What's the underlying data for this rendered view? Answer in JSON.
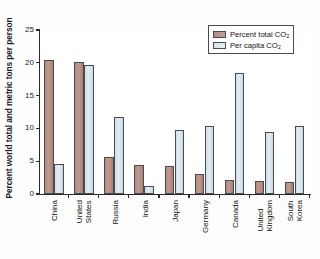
{
  "chart_data": {
    "type": "bar",
    "title": "",
    "xlabel": "",
    "ylabel": "Percent world total and metric tons per person",
    "ylim": [
      0,
      25
    ],
    "yticks": [
      0,
      5,
      10,
      15,
      20,
      25
    ],
    "grid": false,
    "legend_position": "top-right",
    "categories": [
      "China",
      "United States",
      "Russia",
      "India",
      "Japan",
      "Germany",
      "Canada",
      "United Kingdom",
      "South Korea"
    ],
    "category_lines": [
      [
        "China"
      ],
      [
        "United",
        "States"
      ],
      [
        "Russia"
      ],
      [
        "India"
      ],
      [
        "Japan"
      ],
      [
        "Germany"
      ],
      [
        "Canada"
      ],
      [
        "United",
        "Kingdom"
      ],
      [
        "South",
        "Korea"
      ]
    ],
    "series": [
      {
        "name": "Percent total CO2",
        "label_main": "Percent total CO",
        "label_sub": "2",
        "color": "#b3897e",
        "values": [
          20.4,
          20.2,
          5.6,
          4.4,
          4.2,
          3.1,
          2.1,
          2.0,
          1.8
        ]
      },
      {
        "name": "Per capita CO2",
        "label_main": "Per capita CO",
        "label_sub": "2",
        "color": "#d6e4ec",
        "values": [
          4.5,
          19.6,
          11.8,
          1.2,
          9.7,
          10.3,
          18.4,
          9.5,
          10.3
        ]
      }
    ]
  },
  "axis": {
    "y_title": "Percent world total and metric tons per person",
    "tick_labels": [
      "0",
      "5",
      "10",
      "15",
      "20",
      "25"
    ]
  },
  "legend": {
    "items": [
      {
        "main": "Percent total CO",
        "sub": "2"
      },
      {
        "main": "Per capita CO",
        "sub": "2"
      }
    ]
  }
}
